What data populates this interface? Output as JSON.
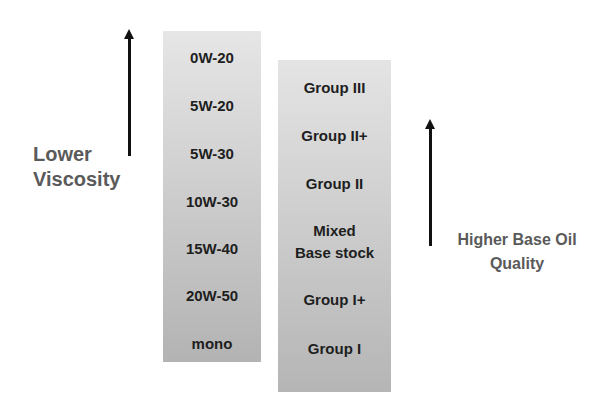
{
  "diagram": {
    "left_axis": {
      "label_line1": "Lower",
      "label_line2": "Viscosity",
      "arrow": "arrow-up"
    },
    "right_axis": {
      "label_line1": "Higher Base Oil",
      "label_line2": "Quality",
      "arrow": "arrow-up"
    },
    "viscosity_grades": [
      "0W-20",
      "5W-20",
      "5W-30",
      "10W-30",
      "15W-40",
      "20W-50",
      "mono"
    ],
    "base_oil_groups": [
      "Group III",
      "Group II+",
      "Group II",
      "Mixed\nBase stock",
      "Group I+",
      "Group I"
    ],
    "base_oil_groups_lines": [
      [
        "Group III"
      ],
      [
        "Group II+"
      ],
      [
        "Group II"
      ],
      [
        "Mixed",
        "Base stock"
      ],
      [
        "Group I+"
      ],
      [
        "Group I"
      ]
    ]
  }
}
